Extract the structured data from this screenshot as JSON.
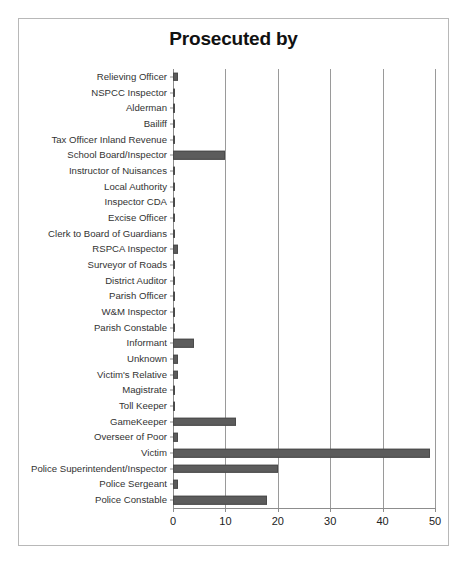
{
  "chart_data": {
    "type": "bar",
    "orientation": "horizontal",
    "title": "Prosecuted by",
    "xlabel": "",
    "ylabel": "",
    "xlim": [
      0,
      50
    ],
    "xticks": [
      0,
      10,
      20,
      30,
      40,
      50
    ],
    "xtick_labels": [
      "0",
      "10",
      "20",
      "30",
      "40",
      "50"
    ],
    "grid": true,
    "legend": false,
    "bar_color": "#5c5c5c",
    "categories": [
      "Relieving Officer",
      "NSPCC Inspector",
      "Alderman",
      "Bailiff",
      "Tax Officer Inland Revenue",
      "School Board/Inspector",
      "Instructor of Nuisances",
      "Local Authority",
      "Inspector CDA",
      "Excise Officer",
      "Clerk to Board of Guardians",
      "RSPCA Inspector",
      "Surveyor of Roads",
      "District Auditor",
      "Parish Officer",
      "W&M Inspector",
      "Parish Constable",
      "Informant",
      "Unknown",
      "Victim's Relative",
      "Magistrate",
      "Toll Keeper",
      "GameKeeper",
      "Overseer of Poor",
      "Victim",
      "Police Superintendent/Inspector",
      "Police Sergeant",
      "Police Constable"
    ],
    "values": [
      1,
      0,
      0,
      0,
      0,
      10,
      0,
      0,
      0,
      0,
      0,
      1,
      0,
      0,
      0,
      0,
      0,
      4,
      1,
      1,
      0,
      0,
      12,
      1,
      49,
      20,
      1,
      18
    ]
  }
}
